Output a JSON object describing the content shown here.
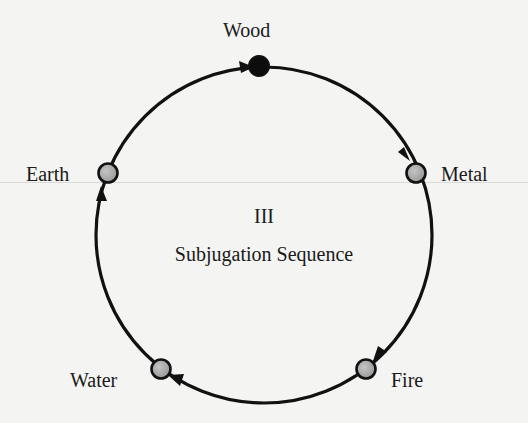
{
  "diagram": {
    "numeral": "III",
    "title": "Subjugation Sequence",
    "nodes": [
      {
        "id": "wood",
        "label": "Wood",
        "style": "filled-black"
      },
      {
        "id": "metal",
        "label": "Metal",
        "style": "filled-gray"
      },
      {
        "id": "fire",
        "label": "Fire",
        "style": "filled-gray"
      },
      {
        "id": "water",
        "label": "Water",
        "style": "filled-gray"
      },
      {
        "id": "earth",
        "label": "Earth",
        "style": "filled-gray"
      }
    ],
    "sequence": [
      "Wood",
      "Metal",
      "Fire",
      "Water",
      "Earth",
      "Wood"
    ],
    "direction": "clockwise",
    "colors": {
      "background": "#f4f4f2",
      "stroke": "#111111",
      "node_gray": "#a8a8a8",
      "node_black": "#0d0d0d"
    }
  }
}
